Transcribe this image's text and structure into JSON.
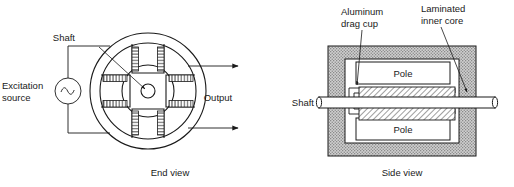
{
  "figure": {
    "title_text": "",
    "background_color": "#ffffff",
    "ink_color": "#1a1a1a",
    "frame_fill_color": "#c9c9c9",
    "white_fill_color": "#ffffff",
    "hatch_color": "#1a1a1a"
  },
  "end_view": {
    "caption": "End view",
    "labels": {
      "shaft": "Shaft",
      "excitation_source_line1": "Excitation",
      "excitation_source_line2": "source",
      "output": "Output"
    },
    "icons": {
      "ac_source": "ac-source-icon",
      "output_arrow": "arrow-right-icon",
      "pointer": "leader-arrow-icon"
    },
    "geometry": {
      "stator_outer_radius": 58,
      "stator_inner_radius": 48,
      "rotor_outer_radius": 26,
      "shaft_radius": 7,
      "pole_count": 4,
      "pole_positions": [
        "top",
        "right",
        "bottom",
        "left"
      ]
    }
  },
  "side_view": {
    "caption": "Side view",
    "labels": {
      "shaft": "Shaft",
      "aluminum_drag_cup_line1": "Aluminum",
      "aluminum_drag_cup_line2": "drag cup",
      "laminated_inner_core_line1": "Laminated",
      "laminated_inner_core_line2": "inner core",
      "pole_top": "Pole",
      "pole_bottom": "Pole"
    },
    "icons": {
      "leader_top_left": "leader-arrow-icon",
      "leader_top_right": "leader-arrow-icon",
      "shaft_end_cap": "shaft-break-icon"
    },
    "geometry": {
      "frame_left": 328,
      "frame_top": 46,
      "frame_width": 148,
      "frame_height": 110,
      "pole_count": 2
    }
  }
}
